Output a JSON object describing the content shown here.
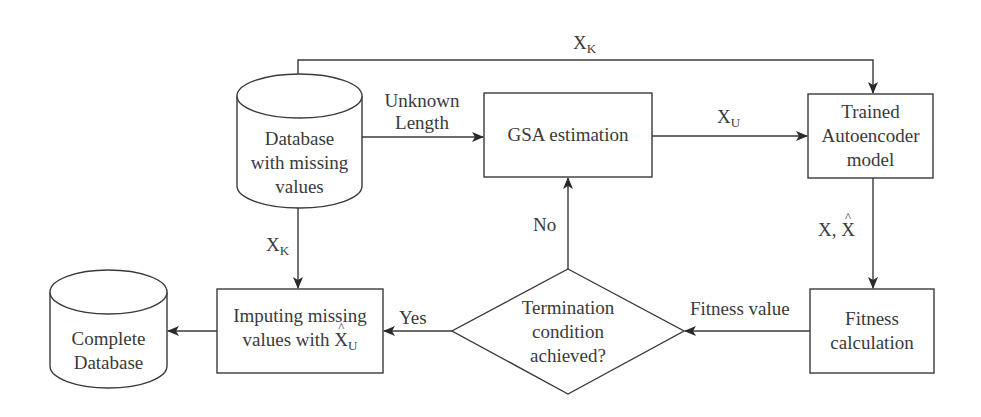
{
  "diagram": {
    "nodes": {
      "database": {
        "type": "cylinder",
        "lines": [
          "Database",
          "with missing",
          "values"
        ]
      },
      "gsa": {
        "type": "rect",
        "lines": [
          "GSA estimation"
        ]
      },
      "autoencoder": {
        "type": "rect",
        "lines": [
          "Trained",
          "Autoencoder",
          "model"
        ]
      },
      "fitness": {
        "type": "rect",
        "lines": [
          "Fitness",
          "calculation"
        ]
      },
      "termination": {
        "type": "diamond",
        "lines": [
          "Termination",
          "condition",
          "achieved?"
        ]
      },
      "imputing": {
        "type": "rect",
        "lines": [
          "Imputing missing",
          "values with"
        ],
        "symbol": "X",
        "symbol_sub": "U",
        "symbol_hat": true
      },
      "complete": {
        "type": "cylinder",
        "lines": [
          "Complete",
          "Database"
        ]
      }
    },
    "edges": {
      "top_xk": {
        "from": "database",
        "to": "autoencoder",
        "label": "X",
        "label_sub": "K"
      },
      "unknown_length": {
        "from": "database",
        "to": "gsa",
        "label_lines": [
          "Unknown",
          "Length"
        ]
      },
      "xu": {
        "from": "gsa",
        "to": "autoencoder",
        "label": "X",
        "label_sub": "U"
      },
      "x_xhat": {
        "from": "autoencoder",
        "to": "fitness",
        "label": "X, ",
        "label_hat": "X"
      },
      "fitness_value": {
        "from": "fitness",
        "to": "termination",
        "label": "Fitness value"
      },
      "no": {
        "from": "termination",
        "to": "gsa",
        "label": "No"
      },
      "yes": {
        "from": "termination",
        "to": "imputing",
        "label": "Yes"
      },
      "down_xk": {
        "from": "database",
        "to": "imputing",
        "label": "X",
        "label_sub": "K"
      },
      "output": {
        "from": "imputing",
        "to": "complete"
      }
    }
  }
}
